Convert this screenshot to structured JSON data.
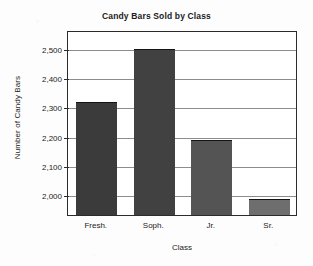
{
  "chart_data": {
    "type": "bar",
    "title": "Candy Bars Sold by Class",
    "xlabel": "Class",
    "ylabel": "Number of Candy Bars",
    "categories": [
      "Fresh.",
      "Soph.",
      "Jr.",
      "Sr."
    ],
    "values": [
      2315,
      2495,
      2185,
      1985
    ],
    "ylim": [
      1930,
      2560
    ],
    "yticks": [
      2000,
      2100,
      2200,
      2300,
      2400,
      2500
    ],
    "ytick_labels": [
      "2,000",
      "2,100",
      "2,200",
      "2,300",
      "2,400",
      "2,500"
    ],
    "grid": "horizontal",
    "legend": "none",
    "bar_colors": [
      "#3b3b3b",
      "#414141",
      "#545454",
      "#6e6e6e"
    ],
    "axis_color": "#2b2b2b",
    "gridline_color": "#8d8d8d",
    "background": "#ffffff"
  }
}
